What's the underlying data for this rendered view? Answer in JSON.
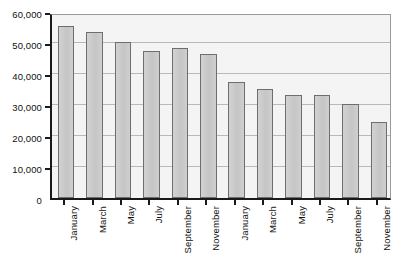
{
  "chart_data": {
    "type": "bar",
    "title": "",
    "subtitle": "",
    "xlabel": "",
    "ylabel": "",
    "ylim": [
      0,
      60000
    ],
    "grid": true,
    "legend": false,
    "legend_position": "none",
    "y_ticks": [
      "0",
      "10,000",
      "20,000",
      "30,000",
      "40,000",
      "50,000",
      "60,000"
    ],
    "y_tick_values": [
      0,
      10000,
      20000,
      30000,
      40000,
      50000,
      60000
    ],
    "categories": [
      "January",
      "March",
      "May",
      "July",
      "September",
      "November",
      "January",
      "March",
      "May",
      "July",
      "September",
      "November"
    ],
    "values": [
      55500,
      53400,
      50300,
      47400,
      48400,
      46400,
      37300,
      35300,
      33200,
      33200,
      30200,
      24400
    ],
    "colors": {
      "bar_fill": "#c9c9c9",
      "bar_stroke": "#6e6e6e",
      "plot_background": "#f4f4f4",
      "axis": "#1a1a1a",
      "gridline": "#b9b9b9",
      "text": "#111111",
      "page_background": "#ffffff"
    }
  }
}
